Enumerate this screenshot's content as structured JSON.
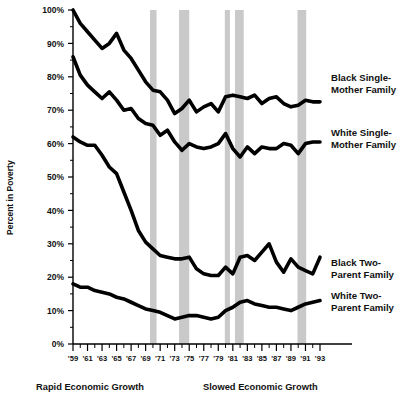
{
  "chart_data": {
    "type": "line",
    "title": "",
    "xlabel": "",
    "ylabel": "Percent in Poverty",
    "ylim": [
      0,
      100
    ],
    "xlim": [
      1959,
      1993
    ],
    "grid": false,
    "legend_position": "right-inline",
    "y_tick_labels": [
      "0%",
      "10%",
      "20%",
      "30%",
      "40%",
      "50%",
      "60%",
      "70%",
      "80%",
      "90%",
      "100%"
    ],
    "y_tick_values": [
      0,
      10,
      20,
      30,
      40,
      50,
      60,
      70,
      80,
      90,
      100
    ],
    "y_minor_tick_values": [
      5,
      15,
      25,
      35,
      45,
      55,
      65,
      75,
      85,
      95
    ],
    "x_tick_labels": [
      "'59",
      "'61",
      "'63",
      "'65",
      "'67",
      "'69",
      "'71",
      "'73",
      "'75",
      "'77",
      "'79",
      "'81",
      "'83",
      "'85",
      "'87",
      "'89",
      "'91",
      "'93"
    ],
    "x_tick_values": [
      1959,
      1961,
      1963,
      1965,
      1967,
      1969,
      1971,
      1973,
      1975,
      1977,
      1979,
      1981,
      1983,
      1985,
      1987,
      1989,
      1991,
      1993
    ],
    "x": [
      1959,
      1960,
      1961,
      1962,
      1963,
      1964,
      1965,
      1966,
      1967,
      1968,
      1969,
      1970,
      1971,
      1972,
      1973,
      1974,
      1975,
      1976,
      1977,
      1978,
      1979,
      1980,
      1981,
      1982,
      1983,
      1984,
      1985,
      1986,
      1987,
      1988,
      1989,
      1990,
      1991,
      1992,
      1993
    ],
    "series": [
      {
        "name": "Black Single-Mother Family",
        "label_line1": "Black Single-",
        "label_line2": "Mother Family",
        "color": "#000000",
        "values": [
          100.0,
          96.0,
          93.5,
          91.0,
          88.5,
          90.0,
          93.0,
          88.0,
          85.5,
          82.0,
          78.5,
          76.0,
          75.5,
          73.0,
          69.0,
          70.5,
          73.0,
          69.5,
          71.0,
          72.0,
          69.5,
          74.0,
          74.5,
          74.0,
          73.5,
          74.5,
          72.0,
          73.5,
          74.0,
          72.0,
          71.0,
          71.5,
          73.0,
          72.5,
          72.5
        ]
      },
      {
        "name": "White Single-Mother Family",
        "label_line1": "White Single-",
        "label_line2": "Mother Family",
        "color": "#000000",
        "values": [
          86.0,
          80.5,
          77.5,
          75.5,
          73.5,
          75.5,
          73.0,
          70.0,
          70.5,
          67.5,
          66.0,
          65.5,
          62.5,
          64.0,
          60.5,
          58.0,
          60.0,
          59.0,
          58.5,
          59.0,
          60.0,
          63.0,
          58.5,
          56.0,
          59.0,
          57.0,
          59.0,
          58.5,
          58.5,
          60.0,
          59.5,
          57.0,
          60.0,
          60.5,
          60.5
        ]
      },
      {
        "name": "Black Two-Parent Family",
        "label_line1": "Black Two-",
        "label_line2": "Parent Family",
        "color": "#000000",
        "values": [
          62.0,
          60.5,
          59.5,
          59.5,
          56.5,
          53.0,
          51.0,
          45.5,
          40.0,
          34.0,
          30.5,
          28.5,
          26.5,
          26.0,
          25.5,
          25.5,
          26.0,
          22.5,
          21.0,
          20.5,
          20.5,
          23.0,
          21.0,
          26.0,
          26.5,
          25.0,
          27.5,
          30.0,
          24.5,
          21.5,
          25.5,
          23.0,
          22.0,
          21.0,
          26.0
        ]
      },
      {
        "name": "White Two-Parent Family",
        "label_line1": "White Two-",
        "label_line2": "Parent Family",
        "color": "#000000",
        "values": [
          18.0,
          17.0,
          17.0,
          16.0,
          15.5,
          15.0,
          14.0,
          13.5,
          12.5,
          11.5,
          10.5,
          10.0,
          9.5,
          8.5,
          7.5,
          8.0,
          8.5,
          8.5,
          8.0,
          7.5,
          8.0,
          10.0,
          11.0,
          12.5,
          13.0,
          12.0,
          11.5,
          11.0,
          11.0,
          10.5,
          10.0,
          11.0,
          12.0,
          12.5,
          13.0
        ]
      }
    ],
    "recession_bands": [
      {
        "start": 1969.6,
        "end": 1970.5
      },
      {
        "start": 1973.6,
        "end": 1975.0
      },
      {
        "start": 1979.9,
        "end": 1980.6
      },
      {
        "start": 1981.3,
        "end": 1982.5
      },
      {
        "start": 1989.9,
        "end": 1991.1
      }
    ],
    "band_color": "#c9c9c9",
    "annotations": [
      {
        "text": "Rapid Economic Growth",
        "x": 1963.5
      },
      {
        "text": "Slowed Economic Growth",
        "x": 1983.0
      }
    ]
  }
}
